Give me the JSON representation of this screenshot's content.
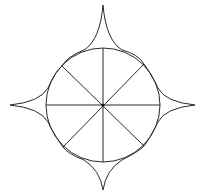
{
  "diagram": {
    "type": "geometric-figure",
    "center": [
      103,
      105
    ],
    "circle_radius": 57,
    "spike_tips": {
      "top": [
        103,
        5
      ],
      "right": [
        195,
        105
      ],
      "bottom": [
        103,
        190
      ],
      "left": [
        10,
        105
      ]
    },
    "diagonal_vertices": [
      [
        62,
        66
      ],
      [
        144,
        64
      ],
      [
        144,
        146
      ],
      [
        63,
        147
      ]
    ],
    "colors": {
      "stroke": "#2a2a2a",
      "background": "#ffffff"
    }
  }
}
